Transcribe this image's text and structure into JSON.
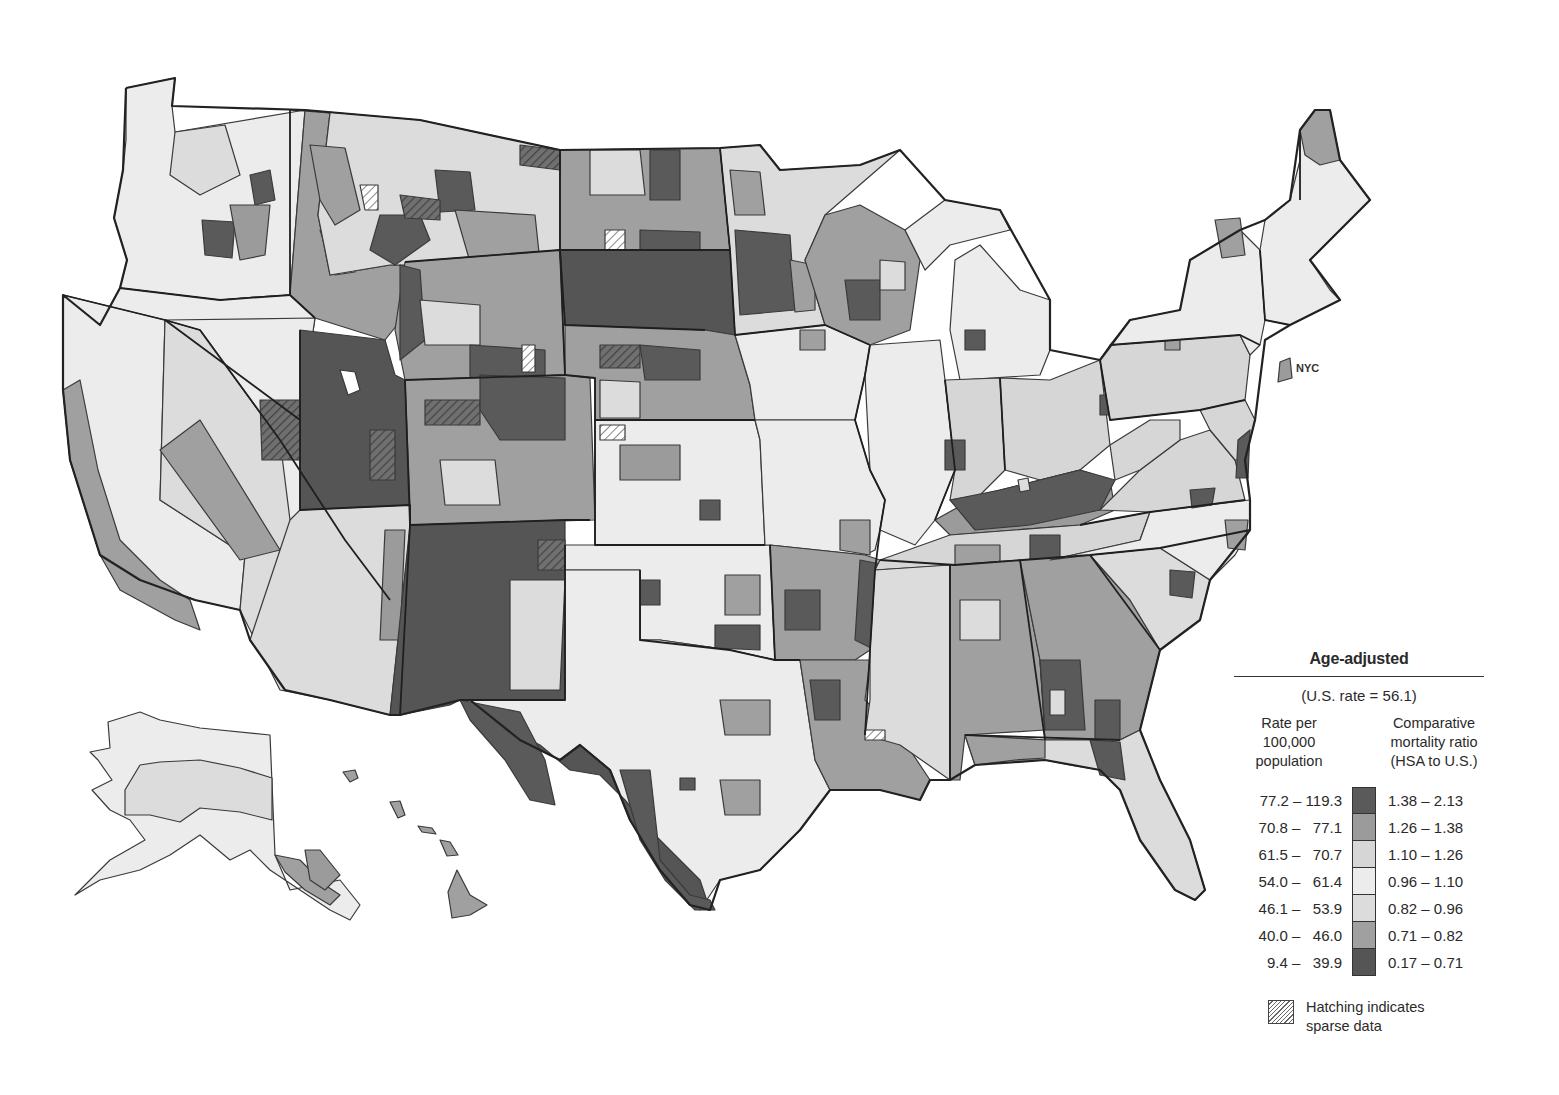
{
  "map": {
    "type": "choropleth",
    "geography": "United States Health Service Areas (HSA)",
    "inset_labels": [
      "NYC"
    ],
    "palette": {
      "1": "#5a5a5a",
      "2": "#9b9b9b",
      "3": "#d6d6d6",
      "4": "#ececec",
      "5": "#dcdcdc",
      "6": "#a0a0a0",
      "7": "#555555"
    },
    "hatch_color": "#777777",
    "regions": [
      {
        "name": "Washington",
        "cls": 4
      },
      {
        "name": "Oregon",
        "cls": 4
      },
      {
        "name": "California north",
        "cls": 4
      },
      {
        "name": "California coast",
        "cls": 6
      },
      {
        "name": "California south",
        "cls": 5
      },
      {
        "name": "Nevada",
        "cls": 4
      },
      {
        "name": "Idaho",
        "cls": 6
      },
      {
        "name": "Montana west",
        "cls": 5
      },
      {
        "name": "Montana east",
        "cls": 5
      },
      {
        "name": "Wyoming",
        "cls": 6
      },
      {
        "name": "Utah",
        "cls": 7
      },
      {
        "name": "Colorado",
        "cls": 6
      },
      {
        "name": "Arizona",
        "cls": 5
      },
      {
        "name": "New Mexico",
        "cls": 7
      },
      {
        "name": "North Dakota",
        "cls": 6
      },
      {
        "name": "South Dakota",
        "cls": 7
      },
      {
        "name": "Nebraska",
        "cls": 6
      },
      {
        "name": "Kansas",
        "cls": 4
      },
      {
        "name": "Oklahoma",
        "cls": 4
      },
      {
        "name": "Texas",
        "cls": 4
      },
      {
        "name": "Texas border",
        "cls": 7
      },
      {
        "name": "Minnesota",
        "cls": 5
      },
      {
        "name": "Iowa",
        "cls": 4
      },
      {
        "name": "Missouri",
        "cls": 4
      },
      {
        "name": "Arkansas",
        "cls": 6
      },
      {
        "name": "Louisiana",
        "cls": 6
      },
      {
        "name": "Wisconsin",
        "cls": 6
      },
      {
        "name": "Illinois",
        "cls": 4
      },
      {
        "name": "Michigan",
        "cls": 4
      },
      {
        "name": "Indiana",
        "cls": 3
      },
      {
        "name": "Ohio",
        "cls": 3
      },
      {
        "name": "Kentucky",
        "cls": 2
      },
      {
        "name": "Tennessee",
        "cls": 3
      },
      {
        "name": "Mississippi",
        "cls": 5
      },
      {
        "name": "Alabama",
        "cls": 6
      },
      {
        "name": "Georgia",
        "cls": 6
      },
      {
        "name": "Florida",
        "cls": 5
      },
      {
        "name": "South Carolina",
        "cls": 5
      },
      {
        "name": "North Carolina",
        "cls": 4
      },
      {
        "name": "Virginia",
        "cls": 3
      },
      {
        "name": "West Virginia",
        "cls": 3
      },
      {
        "name": "Pennsylvania",
        "cls": 3
      },
      {
        "name": "New York",
        "cls": 4
      },
      {
        "name": "New England",
        "cls": 4
      },
      {
        "name": "Maine north",
        "cls": 6
      },
      {
        "name": "NYC",
        "cls": 2
      },
      {
        "name": "Alaska",
        "cls": 4
      },
      {
        "name": "Alaska interior",
        "cls": 5
      },
      {
        "name": "Alaska southeast",
        "cls": 6
      },
      {
        "name": "Hawaii",
        "cls": 6
      }
    ]
  },
  "legend": {
    "title": "Age-adjusted",
    "us_rate": "(U.S. rate = 56.1)",
    "left_header": [
      "Rate per",
      "100,000",
      "population"
    ],
    "right_header": [
      "Comparative",
      "mortality ratio",
      "(HSA to U.S.)"
    ],
    "classes": [
      {
        "rate": "77.2 – 119.3",
        "ratio": "1.38 – 2.13",
        "color": "#5a5a5a"
      },
      {
        "rate": "70.8 –   77.1",
        "ratio": "1.26 – 1.38",
        "color": "#9b9b9b"
      },
      {
        "rate": "61.5 –   70.7",
        "ratio": "1.10 – 1.26",
        "color": "#d6d6d6"
      },
      {
        "rate": "54.0 –   61.4",
        "ratio": "0.96 – 1.10",
        "color": "#ececec"
      },
      {
        "rate": "46.1 –   53.9",
        "ratio": "0.82 – 0.96",
        "color": "#dcdcdc"
      },
      {
        "rate": "40.0 –   46.0",
        "ratio": "0.71 – 0.82",
        "color": "#a0a0a0"
      },
      {
        "rate": "9.4 –   39.9",
        "ratio": "0.17 – 0.71",
        "color": "#555555"
      }
    ],
    "hatch_note": [
      "Hatching indicates",
      "sparse data"
    ]
  },
  "labels": {
    "nyc": "NYC"
  }
}
